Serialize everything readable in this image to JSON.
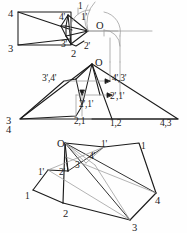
{
  "drawing": {
    "title": "Orthographic projection of a pyramid — three views",
    "ink_color": "#1b1b1b",
    "construction_color": "#9a9a9a",
    "background": "#fefefe",
    "views": [
      {
        "name": "front-view",
        "description": "Rectangle with inner triangular pyramid projection and rotation arcs",
        "labels": [
          {
            "id": "fv-1",
            "text": "1",
            "x": 78,
            "y": 2
          },
          {
            "id": "fv-4",
            "text": "4",
            "x": 8,
            "y": 9
          },
          {
            "id": "fv-4p",
            "text": "4'",
            "x": 59,
            "y": 13
          },
          {
            "id": "fv-1p",
            "text": "1'",
            "x": 81,
            "y": 13
          },
          {
            "id": "fv-O",
            "text": "O",
            "x": 96,
            "y": 21
          },
          {
            "id": "fv-3p",
            "text": "3'",
            "x": 61,
            "y": 40
          },
          {
            "id": "fv-2p",
            "text": "2'",
            "x": 84,
            "y": 42
          },
          {
            "id": "fv-3",
            "text": "3",
            "x": 8,
            "y": 44
          },
          {
            "id": "fv-2",
            "text": "2",
            "x": 71,
            "y": 49
          }
        ]
      },
      {
        "name": "top-view",
        "description": "Triangular top view with construction projectors and coincident point labels",
        "labels": [
          {
            "id": "tv-O",
            "text": "O",
            "x": 95,
            "y": 58
          },
          {
            "id": "tv-34p",
            "text": "3',4'",
            "x": 42,
            "y": 74
          },
          {
            "id": "tv-43p",
            "text": "4',3'",
            "x": 112,
            "y": 74
          },
          {
            "id": "tv-21p",
            "text": "2',1'",
            "x": 110,
            "y": 92
          },
          {
            "id": "tv-21pp",
            "text": "2',1'",
            "x": 79,
            "y": 100
          },
          {
            "id": "tv-3",
            "text": "3",
            "x": 6,
            "y": 116
          },
          {
            "id": "tv-4",
            "text": "4",
            "x": 6,
            "y": 125
          },
          {
            "id": "tv-21",
            "text": "2,1",
            "x": 74,
            "y": 117
          },
          {
            "id": "tv-12",
            "text": "1,2",
            "x": 110,
            "y": 119
          },
          {
            "id": "tv-43",
            "text": "4,3",
            "x": 160,
            "y": 119
          }
        ]
      },
      {
        "name": "pictorial-view",
        "description": "Isometric pictorial of the tilted pyramid with apex O and base 1-2-3-4",
        "labels": [
          {
            "id": "pv-O",
            "text": "O",
            "x": 57,
            "y": 139
          },
          {
            "id": "pv-1p",
            "text": "1'",
            "x": 101,
            "y": 140
          },
          {
            "id": "pv-1r",
            "text": "1",
            "x": 141,
            "y": 142
          },
          {
            "id": "pv-4p",
            "text": "4'",
            "x": 89,
            "y": 152
          },
          {
            "id": "pv-3p",
            "text": "3",
            "x": 75,
            "y": 161
          },
          {
            "id": "pv-1l",
            "text": "1'",
            "x": 38,
            "y": 168
          },
          {
            "id": "pv-2p",
            "text": "2'",
            "x": 59,
            "y": 168
          },
          {
            "id": "pv-1b",
            "text": "1",
            "x": 25,
            "y": 192
          },
          {
            "id": "pv-4",
            "text": "4",
            "x": 155,
            "y": 196
          },
          {
            "id": "pv-2",
            "text": "2",
            "x": 63,
            "y": 209
          },
          {
            "id": "pv-3",
            "text": "3",
            "x": 132,
            "y": 223
          }
        ]
      }
    ]
  }
}
